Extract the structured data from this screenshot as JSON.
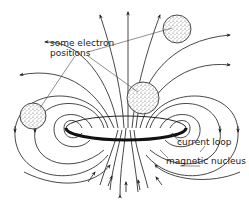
{
  "diagram": {
    "labels": {
      "electron_line1": "some electron",
      "electron_line2": "positions",
      "current_loop": "current loop",
      "magnetic_nucleus": "magnetic nucleus"
    },
    "colors": {
      "line": "#333333",
      "background": "#ffffff",
      "stipple": "#555555"
    },
    "elements": [
      {
        "id": "electron-top-right",
        "type": "stippled-sphere",
        "cx": 177,
        "cy": 29,
        "r": 14
      },
      {
        "id": "electron-left",
        "type": "stippled-sphere",
        "cx": 33,
        "cy": 116,
        "r": 13
      },
      {
        "id": "electron-center",
        "type": "stippled-sphere",
        "cx": 143,
        "cy": 98,
        "r": 16
      },
      {
        "id": "current-loop",
        "type": "ellipse",
        "cx": 126,
        "cy": 128,
        "rx": 60,
        "ry": 12
      }
    ]
  }
}
